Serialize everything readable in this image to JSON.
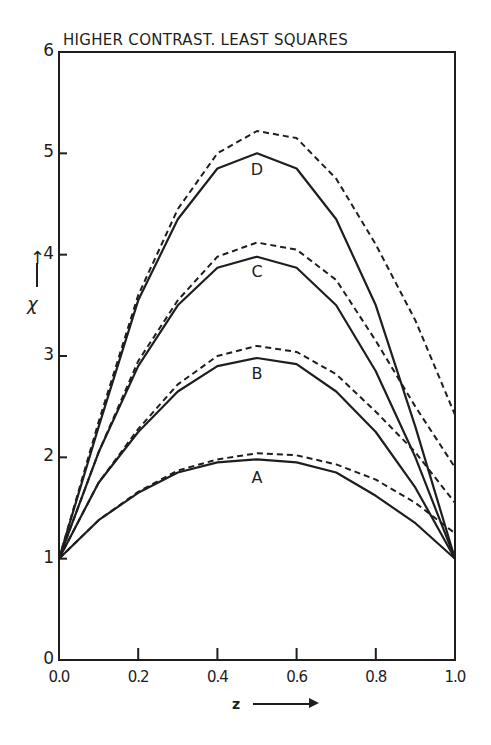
{
  "chart_data": {
    "type": "line",
    "title": "HIGHER CONTRAST. LEAST SQUARES",
    "xlabel": "z",
    "ylabel": "χ",
    "xlim": [
      0.0,
      1.0
    ],
    "ylim": [
      0,
      6
    ],
    "x_ticks": [
      "0.0",
      "0.2",
      "0.4",
      "0.6",
      "0.8",
      "1.0"
    ],
    "y_ticks": [
      "0",
      "1",
      "2",
      "3",
      "4",
      "5",
      "6"
    ],
    "grid": false,
    "legend": "curves labelled A, B, C, D inline; solid and dashed variants per curve",
    "x": [
      0.0,
      0.1,
      0.2,
      0.3,
      0.4,
      0.5,
      0.6,
      0.7,
      0.8,
      0.9,
      1.0
    ],
    "series": [
      {
        "name": "A (solid)",
        "label": "A",
        "style": "solid",
        "values": [
          1.0,
          1.38,
          1.65,
          1.85,
          1.95,
          1.98,
          1.95,
          1.85,
          1.62,
          1.35,
          1.0
        ]
      },
      {
        "name": "A (dashed)",
        "label": "A",
        "style": "dashed",
        "values": [
          1.0,
          1.38,
          1.66,
          1.87,
          1.98,
          2.04,
          2.02,
          1.93,
          1.78,
          1.55,
          1.25
        ]
      },
      {
        "name": "B (solid)",
        "label": "B",
        "style": "solid",
        "values": [
          1.0,
          1.75,
          2.25,
          2.65,
          2.9,
          2.98,
          2.92,
          2.65,
          2.25,
          1.7,
          1.0
        ]
      },
      {
        "name": "B (dashed)",
        "label": "B",
        "style": "dashed",
        "values": [
          1.0,
          1.75,
          2.28,
          2.72,
          3.0,
          3.1,
          3.04,
          2.82,
          2.45,
          2.05,
          1.55
        ]
      },
      {
        "name": "C (solid)",
        "label": "C",
        "style": "solid",
        "values": [
          1.0,
          2.05,
          2.9,
          3.5,
          3.87,
          3.98,
          3.87,
          3.5,
          2.85,
          2.0,
          1.0
        ]
      },
      {
        "name": "C (dashed)",
        "label": "C",
        "style": "dashed",
        "values": [
          1.0,
          2.05,
          2.95,
          3.55,
          3.98,
          4.12,
          4.05,
          3.75,
          3.15,
          2.5,
          1.9
        ]
      },
      {
        "name": "D (solid)",
        "label": "D",
        "style": "solid",
        "values": [
          1.0,
          2.3,
          3.55,
          4.35,
          4.85,
          5.0,
          4.85,
          4.35,
          3.5,
          2.3,
          1.0
        ]
      },
      {
        "name": "D (dashed)",
        "label": "D",
        "style": "dashed",
        "values": [
          1.0,
          2.35,
          3.6,
          4.45,
          5.0,
          5.22,
          5.15,
          4.75,
          4.1,
          3.35,
          2.42
        ]
      }
    ],
    "annotations": [
      {
        "text": "A",
        "x": 0.5,
        "y": 1.8
      },
      {
        "text": "B",
        "x": 0.5,
        "y": 2.82
      },
      {
        "text": "C",
        "x": 0.5,
        "y": 3.83
      },
      {
        "text": "D",
        "x": 0.5,
        "y": 4.84
      }
    ]
  },
  "colors": {
    "ink": "#1e1e1e",
    "background": "#ffffff"
  }
}
